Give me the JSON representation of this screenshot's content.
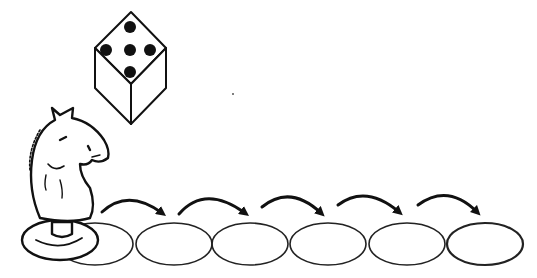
{
  "illustration": {
    "description": "Knight chess piece on the first of six oval spaces, with curved arrows hopping from space to space, and a die showing five",
    "die": {
      "face_value": 5
    },
    "piece": "knight",
    "spaces_count": 6,
    "arrows_count": 5,
    "colors": {
      "ink": "#111111",
      "background": "#ffffff"
    }
  }
}
